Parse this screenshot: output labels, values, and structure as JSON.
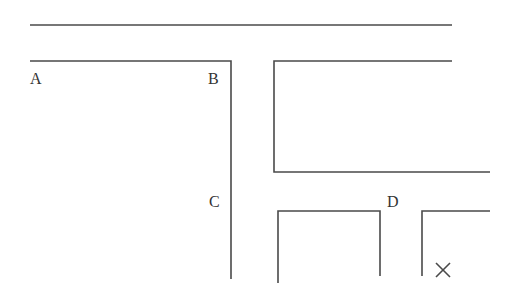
{
  "diagram": {
    "labels": {
      "a": "A",
      "b": "B",
      "c": "C",
      "d": "D",
      "x_mark": "×"
    },
    "colors": {
      "line": "#4a4a4a",
      "text": "#333333",
      "background": "#ffffff"
    }
  }
}
